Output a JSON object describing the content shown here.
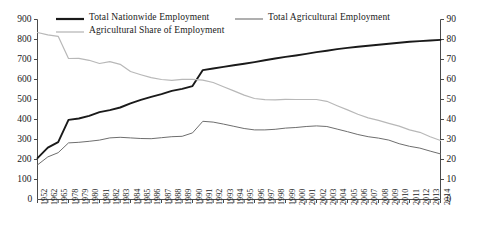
{
  "chart_data": {
    "type": "line",
    "title": "",
    "xlabel": "",
    "ylabel": "",
    "y2label": "",
    "grid": false,
    "legend_position": "top",
    "ylim": [
      0,
      900
    ],
    "y2lim": [
      0,
      90
    ],
    "yticks": [
      100,
      200,
      300,
      400,
      500,
      600,
      700,
      800,
      900
    ],
    "y2ticks": [
      10,
      20,
      30,
      40,
      50,
      60,
      70,
      80,
      90
    ],
    "y_origin_label": "0",
    "y2_origin_label": "0",
    "categories": [
      "1952",
      "1962",
      "1965",
      "1978",
      "1979",
      "1980",
      "1981",
      "1982",
      "1983",
      "1984",
      "1985",
      "1986",
      "1987",
      "1988",
      "1989",
      "1990",
      "1991",
      "1992",
      "1993",
      "1994",
      "1995",
      "1996",
      "1997",
      "1998",
      "1999",
      "2000",
      "2001",
      "2002",
      "2003",
      "2004",
      "2005",
      "2006",
      "2007",
      "2008",
      "2009",
      "2010",
      "2011",
      "2012",
      "2013",
      "2014"
    ],
    "series": [
      {
        "name": "Total Nationwide Employment",
        "axis": "left",
        "color": "#1a1a1a",
        "width": 1.9,
        "values": [
          207,
          259,
          287,
          398,
          405,
          418,
          437,
          447,
          460,
          481,
          498,
          513,
          527,
          543,
          553,
          567,
          647,
          655,
          663,
          671,
          679,
          687,
          696,
          705,
          713,
          720,
          728,
          737,
          744,
          752,
          758,
          764,
          769,
          774,
          779,
          784,
          789,
          792,
          795,
          798
        ]
      },
      {
        "name": "Total Agricultural Employment",
        "axis": "left",
        "color": "#6e6e6e",
        "width": 1.0,
        "values": [
          173,
          213,
          234,
          283,
          286,
          291,
          297,
          308,
          311,
          308,
          305,
          304,
          309,
          314,
          316,
          333,
          391,
          387,
          377,
          366,
          355,
          348,
          348,
          351,
          357,
          360,
          365,
          368,
          365,
          352,
          339,
          325,
          314,
          307,
          297,
          279,
          266,
          257,
          242,
          228
        ]
      },
      {
        "name": "Agricultural Share of Employment",
        "axis": "right",
        "color": "#b8b8b8",
        "width": 1.2,
        "values": [
          83.5,
          82.3,
          81.6,
          70.5,
          70.6,
          69.6,
          68.0,
          68.9,
          67.6,
          64.0,
          62.4,
          60.9,
          60.0,
          59.6,
          60.1,
          60.1,
          59.7,
          58.5,
          56.4,
          54.3,
          52.2,
          50.5,
          49.9,
          49.8,
          50.1,
          50.0,
          50.0,
          50.0,
          49.1,
          46.9,
          44.8,
          42.6,
          40.8,
          39.6,
          38.1,
          36.7,
          34.8,
          33.6,
          31.4,
          29.5
        ]
      }
    ]
  }
}
